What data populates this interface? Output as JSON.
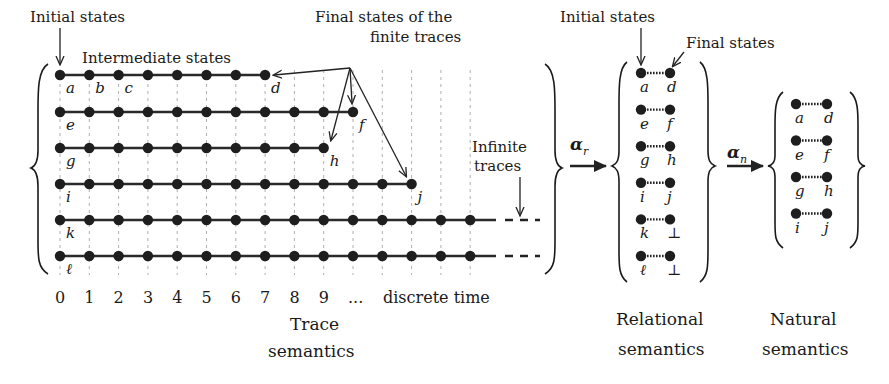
{
  "trace_semantics": {
    "labels": {
      "initial_states": "Initial states",
      "intermediate_states": "Intermediate states",
      "final_states_line1": "Final states of the",
      "final_states_line2": "finite traces",
      "infinite_line1": "Infinite",
      "infinite_line2": "traces",
      "title_line1": "Trace",
      "title_line2": "semantics",
      "discrete_time": "discrete time"
    },
    "time_ticks": [
      "0",
      "1",
      "2",
      "3",
      "4",
      "5",
      "6",
      "7",
      "8",
      "9",
      "..."
    ],
    "x0": 60,
    "dx": 29.3,
    "rows": [
      {
        "y": 75,
        "length": 8,
        "infinite": false,
        "labels": [
          {
            "i": 0,
            "t": "a"
          },
          {
            "i": 1,
            "t": "b"
          },
          {
            "i": 2,
            "t": "c"
          },
          {
            "i": 7,
            "t": "d"
          }
        ]
      },
      {
        "y": 112,
        "length": 11,
        "infinite": false,
        "labels": [
          {
            "i": 0,
            "t": "e"
          },
          {
            "i": 10,
            "t": "f"
          }
        ]
      },
      {
        "y": 148,
        "length": 10,
        "infinite": false,
        "labels": [
          {
            "i": 0,
            "t": "g"
          },
          {
            "i": 9,
            "t": "h"
          }
        ]
      },
      {
        "y": 184,
        "length": 13,
        "infinite": false,
        "labels": [
          {
            "i": 0,
            "t": "i"
          },
          {
            "i": 12,
            "t": "j"
          }
        ]
      },
      {
        "y": 220,
        "length": 15,
        "infinite": true,
        "labels": [
          {
            "i": 0,
            "t": "k"
          }
        ]
      },
      {
        "y": 256,
        "length": 15,
        "infinite": true,
        "labels": [
          {
            "i": 0,
            "t": "ℓ"
          }
        ]
      }
    ]
  },
  "abstractions": {
    "alpha_r": "α",
    "alpha_r_sub": "r",
    "alpha_n": "α",
    "alpha_n_sub": "n"
  },
  "relational_semantics": {
    "labels": {
      "initial_states": "Initial states",
      "final_states": "Final states",
      "title_line1": "Relational",
      "title_line2": "semantics"
    },
    "pairs": [
      {
        "from": "a",
        "to": "d"
      },
      {
        "from": "e",
        "to": "f"
      },
      {
        "from": "g",
        "to": "h"
      },
      {
        "from": "i",
        "to": "j"
      },
      {
        "from": "k",
        "to": "⊥"
      },
      {
        "from": "ℓ",
        "to": "⊥"
      }
    ]
  },
  "natural_semantics": {
    "labels": {
      "title_line1": "Natural",
      "title_line2": "semantics"
    },
    "pairs": [
      {
        "from": "a",
        "to": "d"
      },
      {
        "from": "e",
        "to": "f"
      },
      {
        "from": "g",
        "to": "h"
      },
      {
        "from": "i",
        "to": "j"
      }
    ]
  }
}
